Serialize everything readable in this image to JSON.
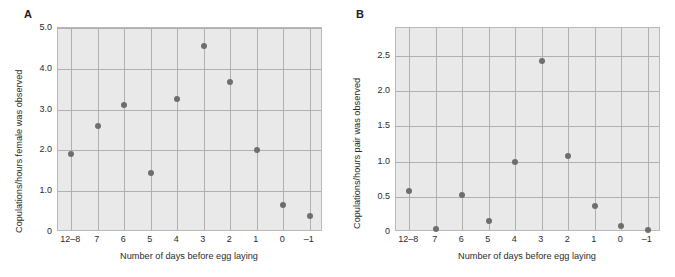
{
  "figure": {
    "background_color": "#ffffff",
    "plot_background_color": "#e9e9e9",
    "gridline_color": "#b0b0b0",
    "marker_color": "#6e6e6e"
  },
  "panels": [
    {
      "letter": "A",
      "ylabel": "Copulations/hours female was observed",
      "xlabel": "Number of days before egg laying",
      "yticks": [
        "0",
        "1.0",
        "2.0",
        "3.0",
        "4.0",
        "5.0"
      ],
      "xticks": [
        "12–8",
        "7",
        "6",
        "5",
        "4",
        "3",
        "2",
        "1",
        "0",
        "–1"
      ]
    },
    {
      "letter": "B",
      "ylabel": "Copulations/hours pair was observed",
      "xlabel": "Number of days before egg laying",
      "yticks": [
        "0",
        "0.5",
        "1.0",
        "1.5",
        "2.0",
        "2.5"
      ],
      "xticks": [
        "12–8",
        "7",
        "6",
        "5",
        "4",
        "3",
        "2",
        "1",
        "0",
        "–1"
      ]
    }
  ],
  "chart_data": [
    {
      "type": "scatter",
      "panel": "A",
      "title": "",
      "xlabel": "Number of days before egg laying",
      "ylabel": "Copulations/hours female was observed",
      "categories": [
        "12–8",
        "7",
        "6",
        "5",
        "4",
        "3",
        "2",
        "1",
        "0",
        "–1"
      ],
      "values": [
        1.9,
        2.6,
        3.12,
        1.45,
        3.26,
        4.55,
        3.67,
        2.01,
        0.67,
        0.39
      ],
      "ylim": [
        0,
        5.0
      ],
      "ytick_values": [
        0,
        1.0,
        2.0,
        3.0,
        4.0,
        5.0
      ],
      "ytick_labels": [
        "0",
        "1.0",
        "2.0",
        "3.0",
        "4.0",
        "5.0"
      ],
      "grid": true,
      "legend": "none"
    },
    {
      "type": "scatter",
      "panel": "B",
      "title": "",
      "xlabel": "Number of days before egg laying",
      "ylabel": "Copulations/hours pair was observed",
      "categories": [
        "12–8",
        "7",
        "6",
        "5",
        "4",
        "3",
        "2",
        "1",
        "0",
        "–1"
      ],
      "values": [
        0.58,
        0.04,
        0.53,
        0.16,
        1.0,
        2.43,
        1.08,
        0.37,
        0.09,
        0.03
      ],
      "ylim": [
        0,
        2.9
      ],
      "ytick_values": [
        0,
        0.5,
        1.0,
        1.5,
        2.0,
        2.5
      ],
      "ytick_labels": [
        "0",
        "0.5",
        "1.0",
        "1.5",
        "2.0",
        "2.5"
      ],
      "grid": true,
      "legend": "none"
    }
  ]
}
